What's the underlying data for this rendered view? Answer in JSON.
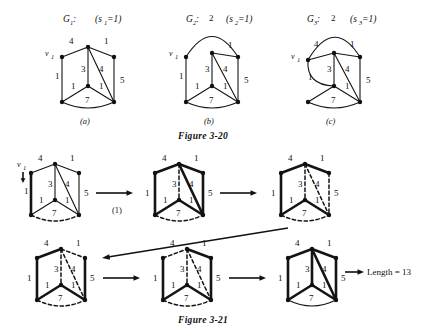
{
  "document": {
    "figures": [
      {
        "id": "figure-3-20",
        "caption": "Figure 3-20",
        "panels": [
          {
            "key": "a",
            "panel_label": "(a)",
            "graph_label": "G",
            "graph_sub": "1",
            "graph_colon": ":",
            "param_open": "(s",
            "param_sub": "1",
            "param_close": "=1)",
            "vertex_label": "v",
            "vertex_sub": "1",
            "edge_weights": [
              "4",
              "1",
              "1",
              "3",
              "4",
              "5",
              "1",
              "1",
              "7"
            ]
          },
          {
            "key": "b",
            "panel_label": "(b)",
            "graph_label": "G",
            "graph_sub": "2",
            "graph_colon": ":",
            "param_open": "(s",
            "param_sub": "2",
            "param_close": "=1)",
            "vertex_label": "v",
            "vertex_sub": "1",
            "arc_weight": "2",
            "edge_weights": [
              "2",
              "1",
              "1",
              "3",
              "4",
              "5",
              "1",
              "1",
              "7"
            ]
          },
          {
            "key": "c",
            "panel_label": "(c)",
            "graph_label": "G",
            "graph_sub": "3",
            "graph_colon": ":",
            "param_open": "(s",
            "param_sub": "3",
            "param_close": "=1)",
            "vertex_label": "v",
            "vertex_sub": "1",
            "arc_weight": "2",
            "edge_weights": [
              "2",
              "4",
              "1",
              "3",
              "4",
              "5",
              "1",
              "1",
              "7"
            ]
          }
        ]
      },
      {
        "id": "figure-3-21",
        "caption": "Figure 3-21",
        "step_label": "(1)",
        "length_label": "Length = 13",
        "vertex_label": "v",
        "vertex_sub": "1",
        "states": [
          {
            "key": "s1",
            "weights": [
              "4",
              "1",
              "1",
              "3",
              "4",
              "5",
              "1",
              "1",
              "7"
            ]
          },
          {
            "key": "s2",
            "weights": [
              "4",
              "1",
              "1",
              "3",
              "4",
              "5",
              "1",
              "1",
              "7"
            ]
          },
          {
            "key": "s3",
            "weights": [
              "4",
              "1",
              "1",
              "3",
              "4",
              "5",
              "1",
              "1",
              "7"
            ]
          },
          {
            "key": "s4",
            "weights": [
              "4",
              "1",
              "1",
              "3",
              "4",
              "5",
              "1",
              "1",
              "7"
            ]
          },
          {
            "key": "s5",
            "weights": [
              "4",
              "1",
              "1",
              "3",
              "4",
              "5",
              "1",
              "1",
              "7"
            ]
          },
          {
            "key": "s6",
            "weights": [
              "4",
              "1",
              "1",
              "3",
              "4",
              "5",
              "1",
              "1",
              "7"
            ]
          }
        ]
      }
    ]
  },
  "colors": {
    "ink": "#111111",
    "paper": "#ffffff"
  }
}
